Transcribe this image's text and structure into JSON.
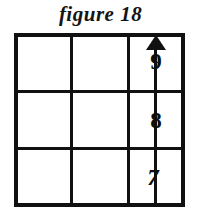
{
  "figure": {
    "caption": "figure 18",
    "background_color": "#ffffff",
    "ink_color": "#111111"
  },
  "grid": {
    "rows": 3,
    "columns": 3,
    "border_color": "#111111",
    "cells": [
      {
        "row": 1,
        "column": 1,
        "label": ""
      },
      {
        "row": 1,
        "column": 2,
        "label": ""
      },
      {
        "row": 1,
        "column": 3,
        "label": "9"
      },
      {
        "row": 2,
        "column": 1,
        "label": ""
      },
      {
        "row": 2,
        "column": 2,
        "label": ""
      },
      {
        "row": 2,
        "column": 3,
        "label": "8"
      },
      {
        "row": 3,
        "column": 1,
        "label": ""
      },
      {
        "row": 3,
        "column": 2,
        "label": ""
      },
      {
        "row": 3,
        "column": 3,
        "label": "7"
      }
    ]
  },
  "arrow": {
    "direction": "up",
    "column": 3,
    "color": "#111111",
    "labels": {
      "top": "9",
      "middle": "8",
      "bottom": "7"
    }
  }
}
